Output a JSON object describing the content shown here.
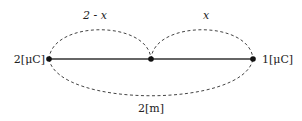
{
  "diagram": {
    "type": "charge-line",
    "charges": {
      "left": {
        "label": "2[μC]"
      },
      "right": {
        "label": "1[μC]"
      }
    },
    "segments": {
      "left_top": {
        "label": "2 - x"
      },
      "right_top": {
        "label": "x"
      },
      "total_bottom": {
        "label": "2[m]"
      }
    },
    "colors": {
      "line": "#333333",
      "dash": "#444444",
      "point": "#111111"
    }
  }
}
